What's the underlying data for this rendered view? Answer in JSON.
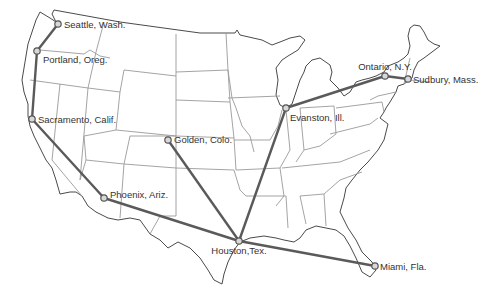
{
  "map": {
    "title": "",
    "region": "Contiguous United States",
    "colors": {
      "route": "#5a5a5a",
      "state_border": "#9a9a9a",
      "coastline": "#4a4a4a",
      "marker_fill": "#d8d8d8",
      "label": "#333333"
    },
    "cities": [
      {
        "id": "seattle",
        "label": "Seattle, Wash."
      },
      {
        "id": "portland",
        "label": "Portland, Oreg."
      },
      {
        "id": "sacramento",
        "label": "Sacramento, Calif."
      },
      {
        "id": "phoenix",
        "label": "Phoenix, Ariz."
      },
      {
        "id": "golden",
        "label": "Golden, Colo."
      },
      {
        "id": "houston",
        "label": "Houston,Tex."
      },
      {
        "id": "miami",
        "label": "Miami, Fla."
      },
      {
        "id": "evanston",
        "label": "Evanston, Ill."
      },
      {
        "id": "ontario",
        "label": "Ontario, N.Y."
      },
      {
        "id": "sudbury",
        "label": "Sudbury, Mass."
      }
    ],
    "routes": [
      [
        "seattle",
        "portland"
      ],
      [
        "portland",
        "sacramento"
      ],
      [
        "sacramento",
        "phoenix"
      ],
      [
        "phoenix",
        "houston"
      ],
      [
        "houston",
        "miami"
      ],
      [
        "golden",
        "houston"
      ],
      [
        "houston",
        "evanston"
      ],
      [
        "evanston",
        "ontario"
      ],
      [
        "ontario",
        "sudbury"
      ]
    ]
  }
}
